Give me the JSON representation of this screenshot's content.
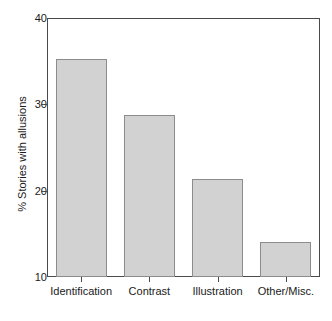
{
  "chart_data": {
    "type": "bar",
    "title": "",
    "xlabel": "",
    "ylabel": "% Stories with allusions",
    "categories": [
      "Identification",
      "Contrast",
      "Illustration",
      "Other/Misc."
    ],
    "values": [
      35.3,
      28.8,
      21.4,
      14.0
    ],
    "ylim": [
      10,
      40
    ],
    "yticks": [
      10,
      20,
      30,
      40
    ],
    "ytick_labels": [
      "10",
      "20",
      "30",
      "40"
    ],
    "grid": false,
    "legend": null,
    "bar_color": "#d2d2d2",
    "bar_border_color": "#8c8c8c",
    "axis_color": "#4a4a4a",
    "text_color": "#1a1a1a"
  }
}
